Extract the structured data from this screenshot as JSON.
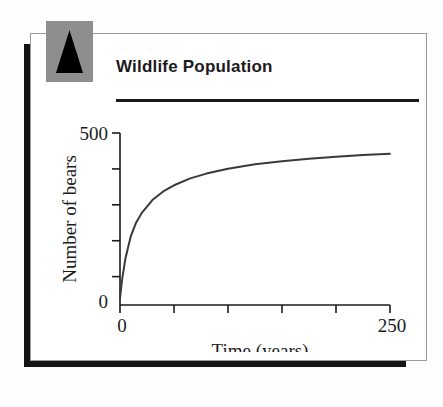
{
  "card": {
    "title": "Wildlife Population",
    "badge_icon": "black-triangle-icon",
    "badge_color": "#8e8e8e",
    "rule_color": "#1b1b1b"
  },
  "chart_data": {
    "type": "line",
    "title": "Wildlife Population",
    "xlabel": "Time (years)",
    "ylabel": "Number of bears",
    "xlim": [
      0,
      250
    ],
    "ylim": [
      0,
      500
    ],
    "xticklabels": [
      "0",
      "250"
    ],
    "yticklabels": [
      "500",
      "0"
    ],
    "x_tick_count": 6,
    "y_tick_count": 5,
    "grid": false,
    "legend": false,
    "line_color": "#3a3a3a",
    "series": [
      {
        "name": "Bear population",
        "x": [
          0,
          2,
          5,
          10,
          15,
          20,
          30,
          40,
          50,
          65,
          80,
          100,
          125,
          150,
          175,
          200,
          225,
          250
        ],
        "values": [
          20,
          75,
          135,
          200,
          240,
          267,
          305,
          330,
          348,
          368,
          382,
          396,
          409,
          418,
          425,
          431,
          436,
          440
        ]
      }
    ]
  }
}
